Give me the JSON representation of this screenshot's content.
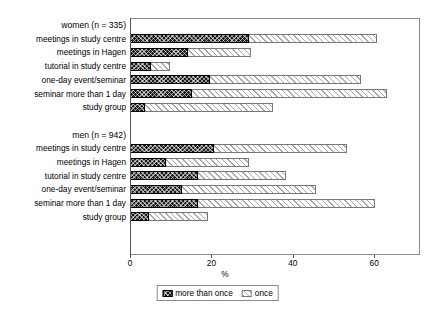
{
  "chart_data": {
    "type": "bar",
    "orientation": "horizontal",
    "stacked": true,
    "title": "",
    "xlabel": "%",
    "ylabel": "",
    "xlim": [
      0,
      71
    ],
    "xticks": [
      0,
      20,
      40,
      60
    ],
    "xticklabels": [
      "0",
      "20",
      "40",
      "60"
    ],
    "grid": false,
    "legend": {
      "position": "bottom-center",
      "entries": [
        "more than once",
        "once"
      ]
    },
    "groups": [
      {
        "name": "women (n = 335)",
        "categories": [
          "meetings in study centre",
          "meetings in Hagen",
          "tutorial in study centre",
          "one-day event/seminar",
          "seminar more than 1 day",
          "study group"
        ],
        "series": [
          {
            "name": "more than once",
            "values": [
              29.0,
              14.0,
              5.0,
              19.5,
              15.0,
              3.5
            ]
          },
          {
            "name": "once",
            "values": [
              31.5,
              15.5,
              4.5,
              37.0,
              48.0,
              31.5
            ]
          }
        ],
        "totals": [
          60.5,
          29.5,
          9.5,
          56.5,
          63.0,
          35.0
        ]
      },
      {
        "name": "men (n = 942)",
        "categories": [
          "meetings in study centre",
          "meetings in Hagen",
          "tutorial in study centre",
          "one-day event/seminar",
          "seminar more than 1 day",
          "study group"
        ],
        "series": [
          {
            "name": "more than once",
            "values": [
              20.5,
              8.5,
              16.5,
              12.5,
              16.5,
              4.5
            ]
          },
          {
            "name": "once",
            "values": [
              32.5,
              20.5,
              21.5,
              33.0,
              43.5,
              14.5
            ]
          }
        ],
        "totals": [
          53.0,
          29.0,
          38.0,
          45.5,
          60.0,
          19.0
        ]
      }
    ]
  },
  "rows": [
    {
      "label": "women (n = 335)",
      "kind": "group",
      "more": null,
      "once": null
    },
    {
      "label": "meetings in study centre",
      "kind": "bar",
      "more": 29.0,
      "once": 31.5
    },
    {
      "label": "meetings in Hagen",
      "kind": "bar",
      "more": 14.0,
      "once": 15.5
    },
    {
      "label": "tutorial in study centre",
      "kind": "bar",
      "more": 5.0,
      "once": 4.5
    },
    {
      "label": "one-day event/seminar",
      "kind": "bar",
      "more": 19.5,
      "once": 37.0
    },
    {
      "label": "seminar more than 1 day",
      "kind": "bar",
      "more": 15.0,
      "once": 48.0
    },
    {
      "label": "study group",
      "kind": "bar",
      "more": 3.5,
      "once": 31.5
    },
    {
      "label": "",
      "kind": "spacer",
      "more": null,
      "once": null
    },
    {
      "label": "men (n = 942)",
      "kind": "group",
      "more": null,
      "once": null
    },
    {
      "label": "meetings in study centre",
      "kind": "bar",
      "more": 20.5,
      "once": 32.5
    },
    {
      "label": "meetings in Hagen",
      "kind": "bar",
      "more": 8.5,
      "once": 20.5
    },
    {
      "label": "tutorial in study centre",
      "kind": "bar",
      "more": 16.5,
      "once": 21.5
    },
    {
      "label": "one-day event/seminar",
      "kind": "bar",
      "more": 12.5,
      "once": 33.0
    },
    {
      "label": "seminar more than 1 day",
      "kind": "bar",
      "more": 16.5,
      "once": 43.5
    },
    {
      "label": "study group",
      "kind": "bar",
      "more": 4.5,
      "once": 14.5
    }
  ],
  "axis": {
    "x_title": "%",
    "ticks": [
      "0",
      "20",
      "40",
      "60"
    ],
    "tick_values": [
      0,
      20,
      40,
      60
    ]
  },
  "legend": {
    "more_label": "more than once",
    "once_label": "once"
  },
  "colors": {
    "more_than_once": "#1a1a1a",
    "once": "#ffffff",
    "once_hatch": "#a8a8a8",
    "frame": "#8a8a8a",
    "text": "#000000"
  }
}
